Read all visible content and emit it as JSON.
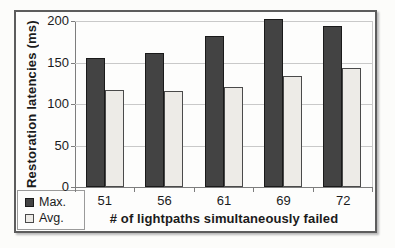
{
  "chart_data": {
    "type": "bar",
    "title": "",
    "xlabel": "# of lightpaths simultaneously failed",
    "ylabel": "Restoration latencies (ms)",
    "categories": [
      "51",
      "56",
      "61",
      "69",
      "72"
    ],
    "series": [
      {
        "name": "Max.",
        "values": [
          155,
          162,
          182,
          203,
          194
        ],
        "fill": "#434343",
        "border": "#1a1a1a"
      },
      {
        "name": "Avg.",
        "values": [
          117,
          116,
          121,
          134,
          143
        ],
        "fill": "#edebe7",
        "border": "#4a4a4a"
      }
    ],
    "ylim": [
      0,
      200
    ],
    "yticks": [
      0,
      50,
      100,
      150,
      200
    ],
    "grid": true,
    "legend_position": "bottom-left"
  },
  "colors": {
    "gridline": "#c9c9c9",
    "axis": "#7d7d7d",
    "figure_border": "#5d5d5d",
    "plot_border": "#c9c9c9",
    "text": "#1b1b1b",
    "background": "#fcfcfa"
  }
}
